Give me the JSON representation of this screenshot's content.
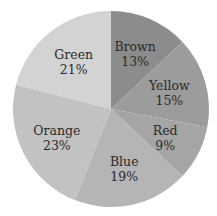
{
  "chart_data": {
    "type": "pie",
    "title": "",
    "start_angle_deg": 0,
    "direction": "clockwise",
    "categories": [
      "Brown",
      "Yellow",
      "Red",
      "Blue",
      "Orange",
      "Green"
    ],
    "values": [
      13,
      15,
      9,
      19,
      23,
      21
    ],
    "labels": [
      "13%",
      "15%",
      "9%",
      "19%",
      "23%",
      "21%"
    ],
    "colors": [
      "#8c8c8c",
      "#9c9c9c",
      "#a5a5a5",
      "#b5b5b5",
      "#c2c2c2",
      "#d3d3d3"
    ],
    "label_position": "inside",
    "legend": "none"
  },
  "geometry": {
    "cx": 111,
    "cy": 109,
    "r": 98
  }
}
